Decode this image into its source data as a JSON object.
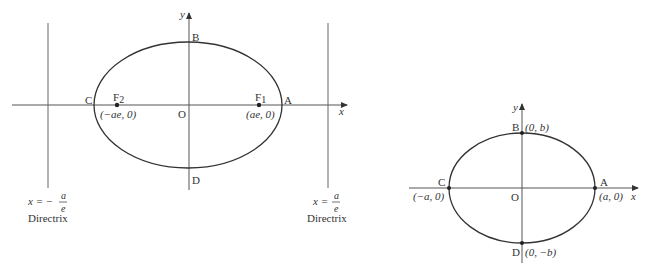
{
  "colors": {
    "stroke": "#333333",
    "axis": "#555555",
    "background": "#ffffff"
  },
  "left_diagram": {
    "axis_labels": {
      "x": "x",
      "y": "y"
    },
    "points": {
      "A": "A",
      "B": "B",
      "C": "C",
      "D": "D",
      "O": "O",
      "F1": "F",
      "F1_sub": "1",
      "F2": "F",
      "F2_sub": "2"
    },
    "coords": {
      "F1": "(ae, 0)",
      "F2": "(−ae, 0)"
    },
    "directrix_left": {
      "eq_prefix": "x = −",
      "num": "a",
      "den": "e",
      "label": "Directrix"
    },
    "directrix_right": {
      "eq_prefix": "x =",
      "num": "a",
      "den": "e",
      "label": "Directrix"
    }
  },
  "right_diagram": {
    "axis_labels": {
      "x": "x",
      "y": "y"
    },
    "points": {
      "A": "A",
      "B": "B",
      "C": "C",
      "D": "D",
      "O": "O"
    },
    "coords": {
      "A": "(a, 0)",
      "B": "(0, b)",
      "C": "(−a, 0)",
      "D": "(0, −b)"
    }
  }
}
